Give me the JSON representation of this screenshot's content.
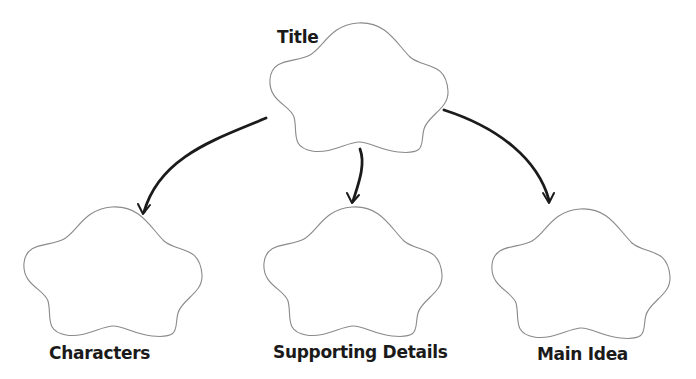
{
  "diagram": {
    "type": "graphic-organizer",
    "colors": {
      "background": "#ffffff",
      "cloud_outline": "#8a8a8a",
      "arrow": "#1b1b1b",
      "text": "#1a1a1a"
    },
    "nodes": [
      {
        "id": "title",
        "label": "Title"
      },
      {
        "id": "characters",
        "label": "Characters"
      },
      {
        "id": "supporting-details",
        "label": "Supporting Details"
      },
      {
        "id": "main-idea",
        "label": "Main Idea"
      }
    ],
    "edges": [
      {
        "from": "title",
        "to": "characters"
      },
      {
        "from": "title",
        "to": "supporting-details"
      },
      {
        "from": "title",
        "to": "main-idea"
      }
    ]
  }
}
